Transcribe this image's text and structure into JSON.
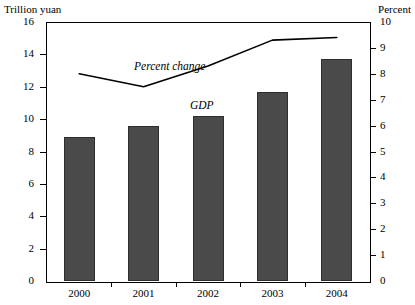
{
  "chart_data": {
    "type": "bar",
    "title": "",
    "subtitle": "",
    "categories": [
      "2000",
      "2001",
      "2002",
      "2003",
      "2004"
    ],
    "xlabel": "",
    "ylabel": "Trillion yuan",
    "y2label": "Percent",
    "ylim": [
      0,
      16
    ],
    "y2lim": [
      0,
      10
    ],
    "grid": false,
    "legend_position": "inline-annotations",
    "series": [
      {
        "name": "GDP",
        "type": "bar",
        "axis": "left",
        "unit": "Trillion yuan",
        "values": [
          8.9,
          9.6,
          10.2,
          11.7,
          13.7
        ]
      },
      {
        "name": "Percent change",
        "type": "line",
        "axis": "right",
        "unit": "Percent",
        "values": [
          8.0,
          7.5,
          8.3,
          9.3,
          9.4
        ]
      }
    ],
    "left_ticks": [
      "0",
      "2",
      "4",
      "6",
      "8",
      "10",
      "12",
      "14",
      "16"
    ],
    "left_tick_values": [
      0,
      2,
      4,
      6,
      8,
      10,
      12,
      14,
      16
    ],
    "right_ticks": [
      "0",
      "1",
      "2",
      "3",
      "4",
      "5",
      "6",
      "7",
      "8",
      "9",
      "10"
    ],
    "right_tick_values": [
      0,
      1,
      2,
      3,
      4,
      5,
      6,
      7,
      8,
      9,
      10
    ],
    "annotations": [
      {
        "text": "Percent change",
        "style": "italic"
      },
      {
        "text": "GDP",
        "style": "italic"
      }
    ],
    "colors": {
      "bar_fill": "#4a4a4a",
      "bar_edge": "#2e2e2e",
      "line": "#000000",
      "axis": "#000000",
      "background": "#ffffff"
    }
  },
  "axes": {
    "left_unit_label": "Trillion yuan",
    "right_unit_label": "Percent"
  },
  "annotations": {
    "percent_change": "Percent change",
    "gdp": "GDP"
  }
}
